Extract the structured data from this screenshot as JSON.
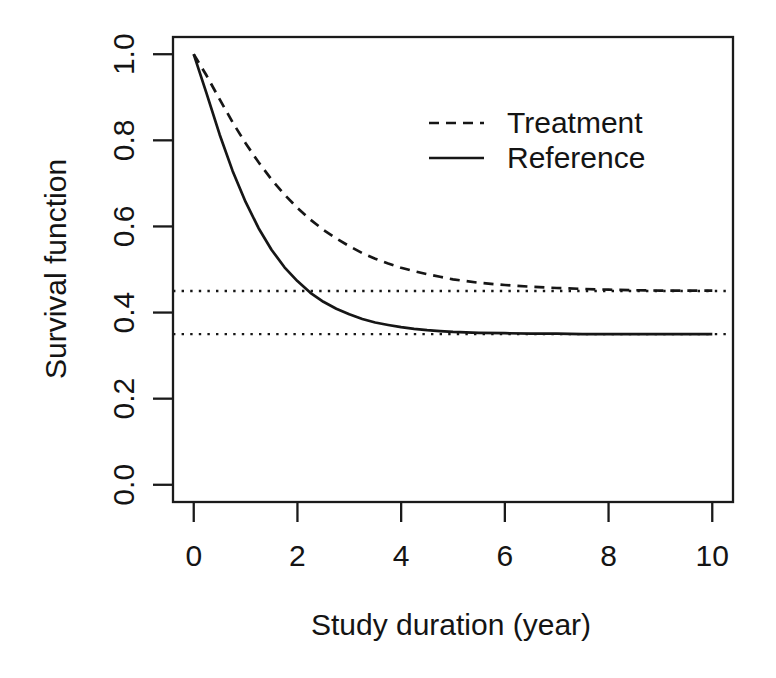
{
  "colors": {
    "ink": "#161616",
    "background": "#ffffff"
  },
  "chart_data": {
    "type": "line",
    "title": "",
    "xlabel": "Study duration (year)",
    "ylabel": "Survival function",
    "xlim": [
      0,
      10
    ],
    "ylim": [
      0.0,
      1.0
    ],
    "xticks": [
      0,
      2,
      4,
      6,
      8,
      10
    ],
    "xtick_labels": [
      "0",
      "2",
      "4",
      "6",
      "8",
      "10"
    ],
    "yticks": [
      0.0,
      0.2,
      0.4,
      0.6,
      0.8,
      1.0
    ],
    "ytick_labels": [
      "0.0",
      "0.2",
      "0.4",
      "0.6",
      "0.8",
      "1.0"
    ],
    "grid": false,
    "legend_position": "inside-top-right",
    "x": [
      0,
      0.25,
      0.5,
      0.75,
      1.0,
      1.25,
      1.5,
      1.75,
      2.0,
      2.25,
      2.5,
      2.75,
      3.0,
      3.25,
      3.5,
      3.75,
      4.0,
      4.25,
      4.5,
      4.75,
      5.0,
      5.5,
      6.0,
      6.5,
      7.0,
      7.5,
      8.0,
      8.5,
      9.0,
      9.5,
      10.0
    ],
    "series": [
      {
        "name": "Treatment",
        "style": "dashed",
        "color": "#161616",
        "plateau": 0.45,
        "values": [
          1.0,
          0.95,
          0.895,
          0.842,
          0.793,
          0.749,
          0.709,
          0.674,
          0.643,
          0.616,
          0.592,
          0.572,
          0.554,
          0.538,
          0.525,
          0.514,
          0.504,
          0.496,
          0.489,
          0.483,
          0.477,
          0.469,
          0.464,
          0.46,
          0.457,
          0.455,
          0.453,
          0.452,
          0.451,
          0.451,
          0.451
        ]
      },
      {
        "name": "Reference",
        "style": "solid",
        "color": "#161616",
        "plateau": 0.35,
        "values": [
          1.0,
          0.908,
          0.813,
          0.729,
          0.657,
          0.596,
          0.546,
          0.505,
          0.473,
          0.446,
          0.425,
          0.409,
          0.396,
          0.385,
          0.377,
          0.371,
          0.366,
          0.362,
          0.359,
          0.357,
          0.355,
          0.353,
          0.352,
          0.351,
          0.351,
          0.35,
          0.35,
          0.35,
          0.35,
          0.35,
          0.35
        ]
      }
    ],
    "reference_lines": [
      {
        "y": 0.45,
        "style": "dotted",
        "color": "#161616"
      },
      {
        "y": 0.35,
        "style": "dotted",
        "color": "#161616"
      }
    ]
  }
}
